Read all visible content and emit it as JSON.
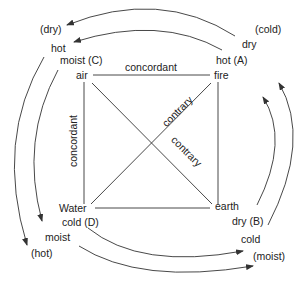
{
  "diagram": {
    "elements": {
      "air": "air",
      "fire": "fire",
      "water": "Water",
      "earth": "earth"
    },
    "qualities": {
      "air": "moist (C)",
      "fire": "hot (A)",
      "water": "cold (D)",
      "earth": "dry (B)"
    },
    "edges": {
      "top": "concordant",
      "left": "concordant",
      "diag_up": "contrary",
      "diag_down": "contrary"
    },
    "arcs": {
      "top_outer_from": "(cold)",
      "top_inner_from": "dry",
      "top_outer_to": "(dry)",
      "top_inner_to": "hot",
      "left_outer_to": "(hot)",
      "left_inner_to": "moist",
      "bottom_inner_to": "cold",
      "bottom_outer_to": "(moist)"
    },
    "colors": {
      "line": "#333333",
      "text": "#222222"
    }
  }
}
